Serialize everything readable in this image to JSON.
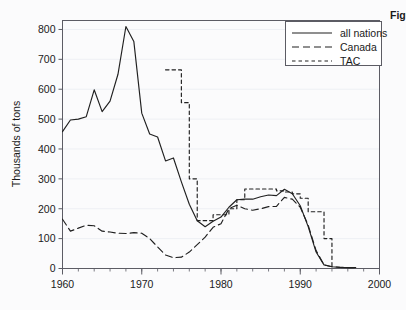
{
  "figure": {
    "caption_fragment": "Figure"
  },
  "chart_data": {
    "type": "line",
    "title": "",
    "xlabel": "",
    "ylabel": "Thousands of tons",
    "xlim": [
      1960,
      2000
    ],
    "ylim": [
      0,
      830
    ],
    "y_axis_max_tick": 800,
    "xticks": [
      1960,
      1970,
      1980,
      1990,
      2000
    ],
    "xtick_labels": [
      "1960",
      "1970",
      "1980",
      "1990",
      "2000"
    ],
    "x_minor_tick_step": 2,
    "yticks": [
      0,
      100,
      200,
      300,
      400,
      500,
      600,
      700,
      800
    ],
    "ytick_labels": [
      "0",
      "100",
      "200",
      "300",
      "400",
      "500",
      "600",
      "700",
      "800"
    ],
    "grid": true,
    "grid_axis": "y",
    "legend_position": "top-right",
    "colors": {
      "line": "#202020",
      "frame": "#5c5c64",
      "grid": "#eef0f4",
      "background": "#fbfbfc"
    },
    "series": [
      {
        "name": "all nations",
        "style": "solid",
        "x": [
          1960,
          1961,
          1962,
          1963,
          1964,
          1965,
          1966,
          1967,
          1968,
          1969,
          1970,
          1971,
          1972,
          1973,
          1974,
          1975,
          1976,
          1977,
          1978,
          1979,
          1980,
          1981,
          1982,
          1983,
          1984,
          1985,
          1986,
          1987,
          1988,
          1989,
          1990,
          1991,
          1992,
          1993,
          1994,
          1995,
          1996,
          1997
        ],
        "values": [
          458,
          497,
          500,
          508,
          598,
          525,
          560,
          650,
          810,
          760,
          520,
          450,
          440,
          360,
          370,
          290,
          215,
          160,
          140,
          158,
          172,
          205,
          230,
          232,
          232,
          240,
          246,
          244,
          265,
          250,
          210,
          140,
          55,
          12,
          6,
          4,
          3,
          3
        ]
      },
      {
        "name": "Canada",
        "style": "long-dash",
        "x": [
          1960,
          1961,
          1962,
          1963,
          1964,
          1965,
          1966,
          1967,
          1968,
          1969,
          1970,
          1971,
          1972,
          1973,
          1974,
          1975,
          1976,
          1977,
          1978,
          1979,
          1980,
          1981,
          1982,
          1983,
          1984,
          1985,
          1986,
          1987,
          1988,
          1989,
          1990,
          1991,
          1992,
          1993,
          1994,
          1995,
          1996,
          1997
        ],
        "values": [
          165,
          125,
          135,
          145,
          143,
          125,
          122,
          118,
          117,
          120,
          118,
          100,
          72,
          45,
          36,
          38,
          55,
          80,
          105,
          138,
          150,
          200,
          212,
          200,
          195,
          200,
          207,
          208,
          238,
          232,
          205,
          145,
          60,
          12,
          6,
          4,
          3,
          3
        ]
      },
      {
        "name": "TAC",
        "style": "short-dash",
        "step": true,
        "x": [
          1973,
          1974,
          1975,
          1976,
          1977,
          1978,
          1979,
          1980,
          1981,
          1982,
          1983,
          1984,
          1985,
          1986,
          1987,
          1988,
          1989,
          1990,
          1991,
          1992,
          1993,
          1994
        ],
        "values": [
          665,
          665,
          555,
          300,
          160,
          160,
          180,
          180,
          200,
          230,
          266,
          266,
          266,
          266,
          260,
          256,
          250,
          235,
          190,
          190,
          100,
          0
        ]
      }
    ],
    "annotations": []
  },
  "legend": {
    "items": [
      {
        "label": "all nations",
        "style": "solid"
      },
      {
        "label": "Canada",
        "style": "long-dash"
      },
      {
        "label": "TAC",
        "style": "short-dash"
      }
    ]
  }
}
